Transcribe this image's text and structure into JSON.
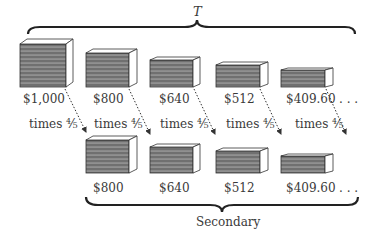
{
  "diagram": {
    "top_brace_label": "T",
    "bottom_brace_label": "Secondary",
    "multiplier_label": "times ⅘",
    "ellipsis": ". . .",
    "top_row": [
      {
        "value": "$1,000"
      },
      {
        "value": "$800"
      },
      {
        "value": "$640"
      },
      {
        "value": "$512"
      },
      {
        "value": "$409.60"
      }
    ],
    "bottom_row": [
      {
        "value": "$800"
      },
      {
        "value": "$640"
      },
      {
        "value": "$512"
      },
      {
        "value": "$409.60"
      }
    ],
    "colors": {
      "box_fill": "#6e6e6e",
      "stripe": "#a8a8a8",
      "outline": "#333333"
    }
  }
}
